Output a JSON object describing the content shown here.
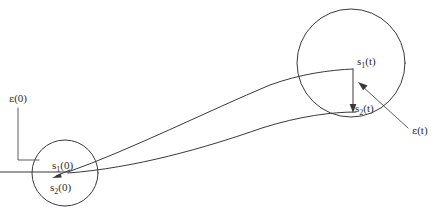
{
  "figure": {
    "background_color": "#ffffff",
    "ink_color": "#3a3a3a",
    "width": 443,
    "height": 213
  },
  "labels": {
    "s1_initial": {
      "symbol": "s",
      "subscript": "1",
      "argument": "(0)",
      "text": "s"
    },
    "s2_initial": {
      "symbol": "s",
      "subscript": "2",
      "argument": "(0)",
      "text": "s"
    },
    "s1_final": {
      "symbol": "s",
      "subscript": "1",
      "argument": "(t)",
      "text": "s"
    },
    "s2_final": {
      "symbol": "s",
      "subscript": "2",
      "argument": "(t)",
      "text": "s"
    },
    "epsilon_initial": {
      "symbol": "ε",
      "argument": "(0)"
    },
    "epsilon_final": {
      "symbol": "ε",
      "argument": "(t)"
    }
  },
  "shapes": {
    "initial_ball": {
      "name": "initial-state-ball",
      "cx": 65,
      "cy": 173,
      "r": 33
    },
    "final_ball": {
      "name": "final-state-ball",
      "cx": 351,
      "cy": 63,
      "r": 54
    }
  },
  "icons": {
    "separation_arrow_initial": "arrow-icon",
    "separation_arrow_final": "arrow-icon",
    "epsilon_leader_initial": "leader-line-icon",
    "epsilon_leader_final": "arrow-icon",
    "trajectory_upper": "curve-icon",
    "trajectory_lower": "curve-icon"
  }
}
